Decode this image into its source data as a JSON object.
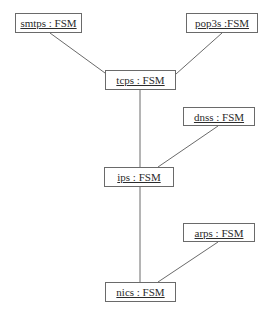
{
  "diagram": {
    "type": "uml-object-diagram",
    "nodes": [
      {
        "id": "smtps",
        "label": "smtps : FSM",
        "x": 15,
        "y": 13,
        "w": 67,
        "h": 20
      },
      {
        "id": "pop3s",
        "label": "pop3s :FSM",
        "x": 186,
        "y": 13,
        "w": 72,
        "h": 20
      },
      {
        "id": "tcps",
        "label": "tcps : FSM",
        "x": 105,
        "y": 70,
        "w": 71,
        "h": 20
      },
      {
        "id": "dnss",
        "label": "dnss : FSM",
        "x": 183,
        "y": 107,
        "w": 72,
        "h": 19
      },
      {
        "id": "ips",
        "label": "ips : FSM",
        "x": 104,
        "y": 167,
        "w": 70,
        "h": 20
      },
      {
        "id": "arps",
        "label": "arps : FSM",
        "x": 183,
        "y": 223,
        "w": 72,
        "h": 19
      },
      {
        "id": "nics",
        "label": "nics : FSM",
        "x": 105,
        "y": 282,
        "w": 71,
        "h": 20
      }
    ],
    "edges": [
      {
        "from": "smtps",
        "to": "tcps",
        "x1": 50,
        "y1": 33,
        "x2": 105,
        "y2": 73
      },
      {
        "from": "pop3s",
        "to": "tcps",
        "x1": 222,
        "y1": 33,
        "x2": 176,
        "y2": 74
      },
      {
        "from": "tcps",
        "to": "ips",
        "x1": 140,
        "y1": 90,
        "x2": 140,
        "y2": 167
      },
      {
        "from": "dnss",
        "to": "ips",
        "x1": 218,
        "y1": 126,
        "x2": 158,
        "y2": 167
      },
      {
        "from": "ips",
        "to": "nics",
        "x1": 140,
        "y1": 187,
        "x2": 140,
        "y2": 282
      },
      {
        "from": "arps",
        "to": "nics",
        "x1": 218,
        "y1": 242,
        "x2": 158,
        "y2": 282
      }
    ]
  }
}
